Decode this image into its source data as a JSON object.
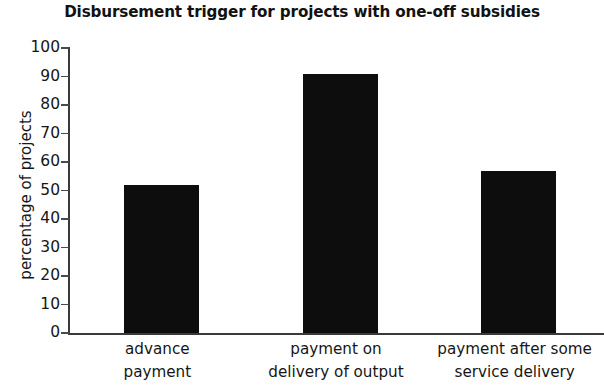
{
  "chart_data": {
    "type": "bar",
    "title": "Disbursement trigger for projects with one-off subsidies",
    "xlabel": "",
    "ylabel": "percentage of projects",
    "categories": [
      "advance payment",
      "payment on delivery of output",
      "payment after some service delivery"
    ],
    "category_lines": [
      [
        "advance",
        "payment"
      ],
      [
        "payment on",
        "delivery of output"
      ],
      [
        "payment after some",
        "service delivery"
      ]
    ],
    "values": [
      52,
      91,
      57
    ],
    "ylim": [
      0,
      100
    ],
    "y_ticks": [
      100,
      90,
      80,
      70,
      60,
      50,
      40,
      30,
      20,
      10,
      0
    ],
    "y_tick_labels": [
      "100",
      "90",
      "80",
      "70",
      "60",
      "50",
      "40",
      "30",
      "20",
      "10",
      "0"
    ],
    "grid": false,
    "legend": false,
    "bar_color": "#0d0d0d",
    "axis_color": "#3a3a3a",
    "background_color": "#ffffff",
    "text_color": "#161616"
  }
}
